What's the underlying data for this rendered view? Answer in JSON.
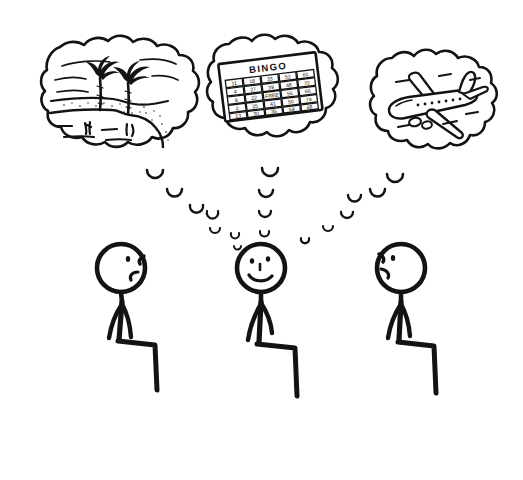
{
  "scene": {
    "title": "Three seated stick figures with thought bubbles",
    "background_color": "#ffffff",
    "ink_color": "#131313",
    "width": 523,
    "height": 480,
    "style": "hand-drawn black ink cartoon on white"
  },
  "thought_bubbles": [
    {
      "id": "bubble-island",
      "content_name": "tropical-island",
      "description": "Desert island with two palm trees, sandy beach and water",
      "center_x": 120,
      "center_y": 95,
      "width": 160,
      "height": 120,
      "elements": [
        "palm-tree",
        "palm-tree",
        "shoreline",
        "sand-speckles",
        "water-ripples"
      ]
    },
    {
      "id": "bubble-bingo",
      "content_name": "bingo-card",
      "description": "Tilted bingo card with header text and a grid of numbered squares",
      "center_x": 270,
      "center_y": 92,
      "width": 130,
      "height": 118,
      "elements": [
        "bingo-header",
        "bingo-grid"
      ]
    },
    {
      "id": "bubble-airplane",
      "content_name": "airliner",
      "description": "Passenger jet airplane in flight with cabin windows",
      "center_x": 430,
      "center_y": 103,
      "width": 130,
      "height": 112,
      "elements": [
        "fuselage",
        "wings",
        "tail-fin",
        "engines",
        "cabin-windows"
      ]
    }
  ],
  "bingo_card": {
    "header": "BINGO",
    "columns": 5,
    "rows": 5,
    "grid": [
      [
        "11",
        "18",
        "33",
        "52",
        "61"
      ],
      [
        "4",
        "27",
        "39",
        "48",
        "70"
      ],
      [
        "9",
        "22",
        "FREE",
        "55",
        "66"
      ],
      [
        "2",
        "25",
        "41",
        "50",
        "74"
      ],
      [
        "13",
        "30",
        "35",
        "59",
        "68"
      ]
    ]
  },
  "figures": [
    {
      "id": "figure-left",
      "label": "left-stick-figure",
      "pose": "seated",
      "facing": "right",
      "expression": "frowning-profile",
      "head_x": 121,
      "head_y": 268,
      "head_r": 24,
      "face_features": [
        "eye-dot",
        "nose-notch",
        "mouth-frown"
      ]
    },
    {
      "id": "figure-middle",
      "label": "middle-stick-figure",
      "pose": "seated",
      "facing": "front",
      "expression": "smiling",
      "head_x": 261,
      "head_y": 268,
      "head_r": 24,
      "face_features": [
        "eye-dot",
        "eye-dot",
        "nose-dot",
        "mouth-smile"
      ]
    },
    {
      "id": "figure-right",
      "label": "right-stick-figure",
      "pose": "seated",
      "facing": "left",
      "expression": "frowning-profile",
      "head_x": 401,
      "head_y": 268,
      "head_r": 24,
      "face_features": [
        "eye-dot",
        "nose-notch",
        "mouth-frown"
      ]
    }
  ],
  "thought_trails": [
    {
      "id": "trail-left",
      "from_bubble": "bubble-island",
      "to_figure": "figure-left",
      "direction": "down-right",
      "bubble_count": 6
    },
    {
      "id": "trail-middle",
      "from_bubble": "bubble-bingo",
      "to_figure": "figure-middle",
      "direction": "down",
      "bubble_count": 5
    },
    {
      "id": "trail-right",
      "from_bubble": "bubble-airplane",
      "to_figure": "figure-right",
      "direction": "down-left",
      "bubble_count": 6
    }
  ]
}
